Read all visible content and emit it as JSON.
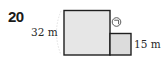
{
  "problem": {
    "number": "20"
  },
  "figure": {
    "type": "composite-rectangle",
    "large_square": {
      "label": "32 m"
    },
    "small_rectangle": {
      "label": "15 m"
    },
    "marker": {
      "symbol": "ㄱ",
      "description": "circled marker ㉠"
    },
    "colors": {
      "fill": "#e6e6e6",
      "stroke": "#1f1f1f"
    }
  }
}
